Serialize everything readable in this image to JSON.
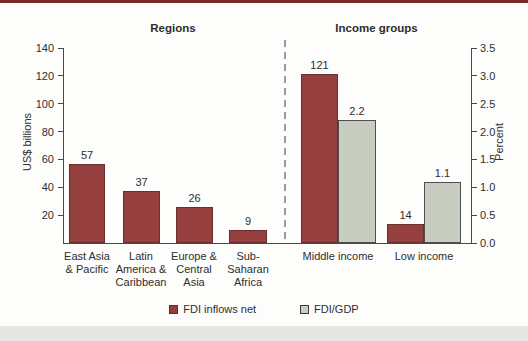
{
  "colors": {
    "top_rule": "#7b2b2b",
    "dark_bar": "#953f3f",
    "dark_bar_border": "#6a2f2f",
    "light_bar": "#c8cdc1",
    "light_bar_border": "#4f4f4f",
    "panel_bg": "#fdfdfb",
    "bottom_strip": "#e7e6e2",
    "axis": "#4a4a4a",
    "text": "#2e2e2e",
    "divider": "#9a9a9a"
  },
  "chart_data": {
    "type": "bar",
    "sections": [
      {
        "title": "Regions"
      },
      {
        "title": "Income groups"
      }
    ],
    "left_axis": {
      "label": "US$ billions",
      "max": 140,
      "min": 0,
      "ticks": [
        "20",
        "40",
        "60",
        "80",
        "100",
        "120",
        "140"
      ]
    },
    "right_axis": {
      "label": "Percent",
      "max": 3.5,
      "min": 0,
      "ticks": [
        "0.0",
        "0.5",
        "1.0",
        "1.5",
        "2.0",
        "2.5",
        "3.0",
        "3.5"
      ]
    },
    "legend": [
      {
        "label": "FDI inflows net",
        "swatch": "dark"
      },
      {
        "label": "FDI/GDP",
        "swatch": "light"
      }
    ],
    "groups": [
      {
        "section": "Regions",
        "label_lines": [
          "East Asia",
          "& Pacific"
        ],
        "bars": [
          {
            "series": "FDI inflows net",
            "axis": "left",
            "value": 57,
            "label": "57"
          }
        ]
      },
      {
        "section": "Regions",
        "label_lines": [
          "Latin",
          "America &",
          "Caribbean"
        ],
        "bars": [
          {
            "series": "FDI inflows net",
            "axis": "left",
            "value": 37,
            "label": "37"
          }
        ]
      },
      {
        "section": "Regions",
        "label_lines": [
          "Europe &",
          "Central",
          "Asia"
        ],
        "bars": [
          {
            "series": "FDI inflows net",
            "axis": "left",
            "value": 26,
            "label": "26"
          }
        ]
      },
      {
        "section": "Regions",
        "label_lines": [
          "Sub-",
          "Saharan",
          "Africa"
        ],
        "bars": [
          {
            "series": "FDI inflows net",
            "axis": "left",
            "value": 9,
            "label": "9"
          }
        ]
      },
      {
        "section": "Income groups",
        "label_lines": [
          "Middle income"
        ],
        "bars": [
          {
            "series": "FDI inflows net",
            "axis": "left",
            "value": 121,
            "label": "121"
          },
          {
            "series": "FDI/GDP",
            "axis": "right",
            "value": 2.2,
            "label": "2.2"
          }
        ]
      },
      {
        "section": "Income groups",
        "label_lines": [
          "Low income"
        ],
        "bars": [
          {
            "series": "FDI inflows net",
            "axis": "left",
            "value": 14,
            "label": "14"
          },
          {
            "series": "FDI/GDP",
            "axis": "right",
            "value": 1.1,
            "label": "1.1"
          }
        ]
      }
    ]
  }
}
